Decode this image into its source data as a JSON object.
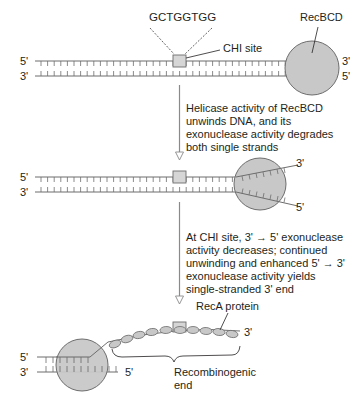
{
  "diagram": {
    "colors": {
      "ink": "#231f20",
      "strand": "#6d6d6d",
      "protein_fill": "#c8c8c8",
      "protein_stroke": "#6d6d6d",
      "chi_fill": "#d6d6d6",
      "arrow": "#8a8a8a"
    },
    "stage1": {
      "sequence": "GCTGGTGG",
      "chi_label": "CHI site",
      "enzyme_label": "RecBCD",
      "left_top": "5'",
      "left_bottom": "3'",
      "right_top": "3'",
      "right_bottom": "5'"
    },
    "step1": {
      "lines": [
        "Helicase activity of RecBCD",
        "unwinds DNA, and its",
        "exonuclease activity degrades",
        "both single strands"
      ]
    },
    "stage2": {
      "left_top": "5'",
      "left_bottom": "3'",
      "right_top": "3'",
      "right_bottom": "5'"
    },
    "step2": {
      "lines": [
        "At CHI site, 3' → 5' exonuclease",
        "activity decreases; continued",
        "unwinding and enhanced 5' → 3'",
        "exonuclease activity yields",
        "single-stranded 3' end"
      ]
    },
    "stage3": {
      "reca_label": "RecA protein",
      "strand_end": "3'",
      "left_top": "5'",
      "left_bottom": "3'",
      "bottom_right": "5'",
      "brace_label_lines": [
        "Recombinogenic",
        "end"
      ]
    }
  }
}
